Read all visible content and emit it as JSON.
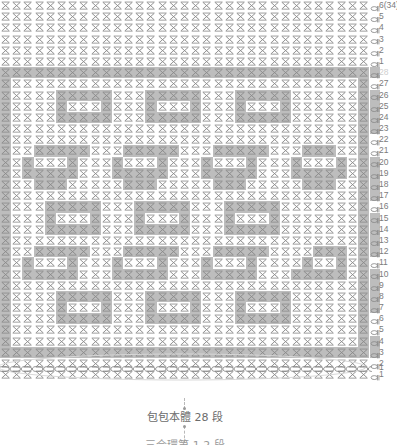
{
  "document": {
    "type": "crochet-pattern-chart",
    "title_caption": "包包本體 28 段",
    "sub_caption": "三合環第 1 2 段",
    "colors": {
      "stitch_symbol": "#8a8a8a",
      "shaded_cell": "#bdbdbd",
      "row_number": "#7b7b7b",
      "row_number_faint": "#cfcfcf",
      "caption_text": "#6b6b6b",
      "guide_line": "#b9b9b9",
      "background": "#ffffff"
    }
  },
  "chart_data": {
    "type": "heatmap",
    "title": "包包本體 28 段",
    "xlabel": "",
    "ylabel": "",
    "columns": 33,
    "rows": 34,
    "legend": [
      {
        "symbol": "X",
        "name": "single-crochet",
        "label": "X"
      },
      {
        "symbol": "chain",
        "name": "turning-chain",
        "label": "T"
      }
    ],
    "row_labels": [
      "6(34)",
      "5",
      "4",
      "3",
      "2",
      "1",
      "28",
      "27",
      "26",
      "25",
      "24",
      "23",
      "22",
      "21",
      "20",
      "19",
      "18",
      "17",
      "16",
      "15",
      "14",
      "13",
      "12",
      "11",
      "10",
      "9",
      "8",
      "7",
      "6",
      "5",
      "4",
      "3",
      "2",
      "1"
    ],
    "faint_row_labels": [
      "28"
    ],
    "grid": [
      "000000000000000000000000000000000",
      "000000000000000000000000000000000",
      "000000000000000000000000000000000",
      "000000000000000000000000000000000",
      "000000000000000000000000000000000",
      "000000000000000000000000000000000",
      "111111111111111111111111111111111",
      "100000000000000000000000000000001",
      "100001111100011111000111110000001",
      "100001000100010001000100010000001",
      "100001111100011111000111110000001",
      "100000000000000000000000000000001",
      "100000000000000000000000000000001",
      "100111110001111100011111000111001",
      "101000100010001000100010001000101",
      "101111100011111000111110001111101",
      "100111000001110000011100000111001",
      "100000000000000000000000000000001",
      "100011111000111110001111100000001",
      "100010001000100010001000100000001",
      "100011111000111110001111100000001",
      "100000000000000000000000000000001",
      "100111110001111100011111000011101",
      "101000100010001000100010000100101",
      "101111100011111000111110001111101",
      "100000000000000000000000000000001",
      "100001111100011111000111110000001",
      "100001000100010001000100010000001",
      "100001111100011111000111110000001",
      "100000000000000000000000000000001",
      "100000000000000000000000000000001",
      "111111111111111111111111111111111",
      "000000000000000000000000000000000",
      "000000000000000000000000000000000"
    ],
    "turning_chain": [
      0,
      0,
      0,
      0,
      0,
      0,
      1,
      0,
      1,
      1,
      1,
      1,
      0,
      0,
      1,
      1,
      1,
      1,
      0,
      1,
      1,
      1,
      1,
      0,
      1,
      1,
      1,
      1,
      0,
      0,
      1,
      1,
      0,
      0
    ]
  },
  "foundation": {
    "label": "foundation-chain",
    "stitch_count": 33,
    "row_number": "1"
  },
  "captions": {
    "main": "包包本體 28 段",
    "sub": "三合環第 1 2 段"
  }
}
